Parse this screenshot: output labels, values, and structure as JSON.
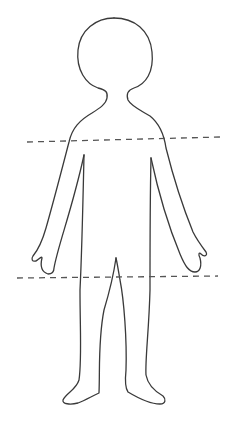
{
  "figure": {
    "stroke_color": "#3a3a3a",
    "background": "#ffffff",
    "guide_lines": [
      {
        "name": "upper-cut-line",
        "style": "dashed"
      },
      {
        "name": "lower-cut-line",
        "style": "dashed"
      }
    ]
  }
}
